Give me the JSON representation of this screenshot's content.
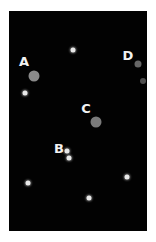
{
  "diagram": {
    "background_color": "#020202",
    "labels": [
      {
        "id": "A",
        "text": "A",
        "x": 24,
        "y": 61
      },
      {
        "id": "B",
        "text": "B",
        "x": 59,
        "y": 148
      },
      {
        "id": "C",
        "text": "C",
        "x": 86,
        "y": 108
      },
      {
        "id": "D",
        "text": "D",
        "x": 128,
        "y": 55
      }
    ],
    "large_objects": [
      {
        "label": "A",
        "x": 34,
        "y": 76,
        "diameter": 11,
        "color": "#8a8a8a"
      },
      {
        "label": "C",
        "x": 96,
        "y": 122,
        "diameter": 11,
        "color": "#7a7a7a"
      },
      {
        "label": "D",
        "x": 138,
        "y": 64,
        "diameter": 7,
        "color": "#666666"
      },
      {
        "label": "D",
        "x": 143,
        "y": 81,
        "diameter": 6,
        "color": "#4f4f4f"
      }
    ],
    "small_stars": [
      {
        "x": 73,
        "y": 50
      },
      {
        "x": 25,
        "y": 93
      },
      {
        "x": 67,
        "y": 151
      },
      {
        "x": 69,
        "y": 158
      },
      {
        "x": 28,
        "y": 183
      },
      {
        "x": 127,
        "y": 177
      },
      {
        "x": 89,
        "y": 198
      }
    ]
  }
}
